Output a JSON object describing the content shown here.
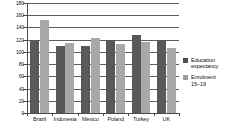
{
  "chart_data": {
    "type": "bar",
    "title": "",
    "subtitle": "",
    "xlabel": "",
    "ylabel": "",
    "categories": [
      "Brazil",
      "Indonesia",
      "Mexico",
      "Poland",
      "Turkey",
      "UK"
    ],
    "series": [
      {
        "name": "Education expectancy",
        "legend_label": "Education\nexpectancy",
        "color": "#595959",
        "values": [
          120,
          109,
          110,
          120,
          128,
          120
        ]
      },
      {
        "name": "Enrolment 15-19",
        "legend_label": "Enrolment\n15–19",
        "color": "#a8a8a8",
        "values": [
          153,
          115,
          123,
          113,
          117,
          107
        ]
      }
    ],
    "ylim": [
      0,
      180
    ],
    "ytick_values": [
      180,
      160,
      140,
      120,
      100,
      80,
      60,
      40,
      20,
      0
    ],
    "ytick_labels": [
      "180",
      "160",
      "140",
      "120",
      "100",
      "80",
      "60",
      "40",
      "20",
      "0"
    ],
    "grid": true,
    "grid_axis": "y",
    "legend_position": "right",
    "background": "#ffffff",
    "axis_color": "#4a4a4a",
    "grid_color": "#5d5d5d"
  }
}
